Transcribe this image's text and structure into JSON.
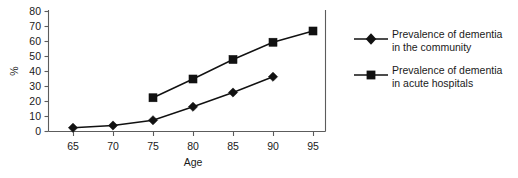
{
  "chart_data": {
    "type": "line",
    "title": "",
    "subtitle": "",
    "xlabel": "Age",
    "ylabel": "%",
    "x": [
      65,
      70,
      75,
      80,
      85,
      90,
      95
    ],
    "xlim": [
      62.5,
      97.5
    ],
    "ylim": [
      0,
      80
    ],
    "xticks": [
      "65",
      "70",
      "75",
      "80",
      "85",
      "90",
      "95"
    ],
    "yticks": [
      "0",
      "10",
      "20",
      "30",
      "40",
      "50",
      "60",
      "70",
      "80"
    ],
    "grid": false,
    "legend_position": "right",
    "series": [
      {
        "name": "Prevalence of dementia in the community",
        "marker": "diamond",
        "color": "#111111",
        "x": [
          65,
          70,
          75,
          80,
          85,
          90
        ],
        "values": [
          2.5,
          4,
          7.5,
          16.5,
          26,
          36.5
        ]
      },
      {
        "name": "Prevalence of dementia in acute hospitals",
        "marker": "square",
        "color": "#111111",
        "x": [
          75,
          80,
          85,
          90,
          95
        ],
        "values": [
          22.5,
          35,
          48,
          59.5,
          67
        ]
      }
    ]
  },
  "axes": {
    "y_label": "%",
    "x_label": "Age",
    "y_ticks": [
      "80",
      "70",
      "60",
      "50",
      "40",
      "30",
      "20",
      "10",
      "0"
    ],
    "x_ticks": [
      "65",
      "70",
      "75",
      "80",
      "85",
      "90",
      "95"
    ]
  },
  "legend": {
    "items": [
      {
        "marker": "diamond",
        "line1": "Prevalence of dementia",
        "line2": "in the community"
      },
      {
        "marker": "square",
        "line1": "Prevalence of dementia",
        "line2": "in acute hospitals"
      }
    ]
  }
}
